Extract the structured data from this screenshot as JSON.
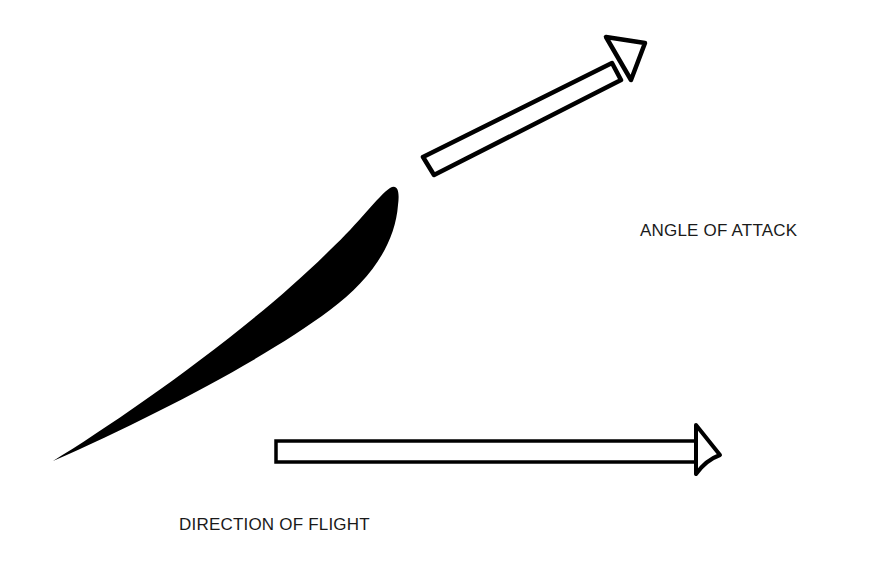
{
  "diagram": {
    "type": "airfoil-angle-of-attack",
    "labels": {
      "angle_of_attack": "ANGLE OF ATTACK",
      "direction_of_flight": "DIRECTION OF FLIGHT"
    },
    "elements": [
      {
        "id": "airfoil",
        "kind": "filled-shape",
        "description": "black cambered airfoil cross-section, leading edge upper right, trailing edge lower left"
      },
      {
        "id": "relative-wind-arrow",
        "kind": "hollow-arrow",
        "direction": "up-right",
        "angle_deg": 28
      },
      {
        "id": "flight-arrow",
        "kind": "hollow-arrow",
        "direction": "right",
        "angle_deg": 0
      }
    ],
    "colors": {
      "background": "#ffffff",
      "ink": "#000000",
      "text": "#1a1a1a"
    }
  }
}
